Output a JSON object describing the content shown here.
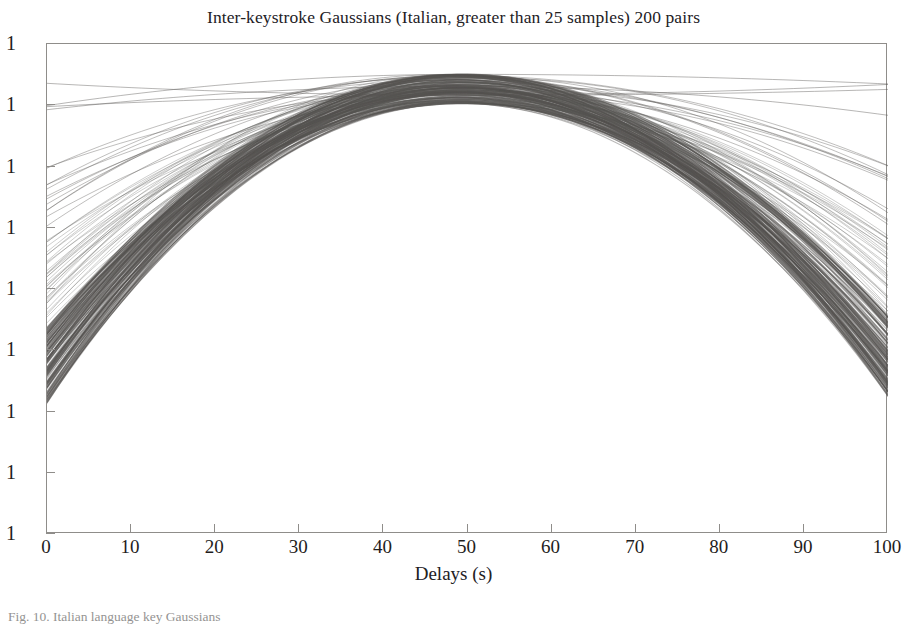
{
  "figure": {
    "title": "Inter-keystroke Gaussians (Italian, greater than 25 samples) 200 pairs",
    "caption": "Fig. 10.  Italian language key Gaussians",
    "ink_color": "#555351",
    "axis_color": "#8f8d8a",
    "background": "#ffffff"
  },
  "chart_data": {
    "type": "line",
    "title": "Inter-keystroke Gaussians (Italian, greater than 25 samples) 200 pairs",
    "xlabel": "Delays (s)",
    "ylabel": "",
    "xlim": [
      0,
      100
    ],
    "ylim": [
      0,
      9
    ],
    "grid": false,
    "legend": null,
    "n_series": 200,
    "series_description": "200 overlapping Gaussian probability curves, one per key pair, plotted on a logarithmic vertical axis; all peak near x = 48-50 and decay toward both edges.",
    "xticks": [
      0,
      10,
      20,
      30,
      40,
      50,
      60,
      70,
      80,
      90,
      100
    ],
    "xticklabels": [
      "0",
      "10",
      "20",
      "30",
      "40",
      "50",
      "60",
      "70",
      "80",
      "90",
      "100"
    ],
    "yticks": [
      0,
      1,
      2,
      3,
      4,
      5,
      6,
      7,
      8
    ],
    "yticklabels": [
      "1",
      "1",
      "1",
      "1",
      "1",
      "1",
      "1",
      "1",
      "1"
    ],
    "peak_center_range": [
      47,
      51
    ],
    "curves": [
      {
        "name": "bundle-core",
        "count": 150,
        "mu_range": [
          48,
          50
        ],
        "sigma_range": [
          30,
          46
        ],
        "left_edge_decades": [
          5.2,
          6.6
        ],
        "right_edge_decades": [
          5.0,
          6.5
        ],
        "weight": "dense"
      },
      {
        "name": "bundle-mid",
        "count": 34,
        "mu_range": [
          47,
          51
        ],
        "sigma_range": [
          24,
          30
        ],
        "left_edge_decades": [
          3.6,
          5.2
        ],
        "right_edge_decades": [
          3.4,
          5.0
        ],
        "weight": "medium"
      },
      {
        "name": "bundle-spread",
        "count": 12,
        "mu_range": [
          46,
          52
        ],
        "sigma_range": [
          19,
          24
        ],
        "left_edge_decades": [
          2.2,
          3.6
        ],
        "right_edge_decades": [
          2.0,
          3.4
        ],
        "weight": "light"
      },
      {
        "name": "outlier-narrow",
        "count": 4,
        "mu_range": [
          48,
          50
        ],
        "sigma_range": [
          15,
          18
        ],
        "left_edge_decades": [
          0.6,
          2.0
        ],
        "right_edge_decades": [
          0.5,
          1.9
        ],
        "weight": "faint"
      }
    ]
  },
  "axes": {
    "y_tick_labels": [
      "1",
      "1",
      "1",
      "1",
      "1",
      "1",
      "1",
      "1",
      "1"
    ],
    "x_tick_labels": [
      "0",
      "10",
      "20",
      "30",
      "40",
      "50",
      "60",
      "70",
      "80",
      "90",
      "100"
    ],
    "x_axis_title": "Delays (s)"
  }
}
